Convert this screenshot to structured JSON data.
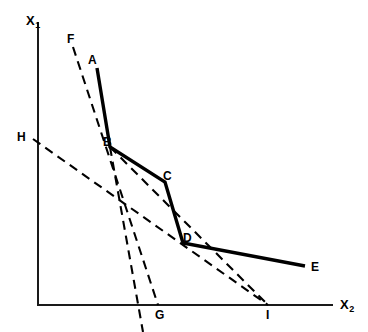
{
  "figure": {
    "type": "line-diagram",
    "background_color": "#ffffff",
    "stroke_color": "#000000",
    "width": 368,
    "height": 332
  },
  "axes": {
    "origin": {
      "x": 38,
      "y": 305
    },
    "y_axis": {
      "label_text": "X",
      "label_sub": "1",
      "label_x": 26,
      "label_y": 14,
      "top_y": 22,
      "bottom_y": 305
    },
    "x_axis": {
      "label_text": "X",
      "label_sub": "2",
      "label_x": 340,
      "label_y": 298,
      "left_x": 38,
      "right_x": 333
    }
  },
  "points": {
    "A": {
      "label": "A",
      "x": 97,
      "y": 68,
      "label_x": 88,
      "label_y": 54
    },
    "B": {
      "label": "B",
      "x": 110,
      "y": 147,
      "label_x": 103,
      "label_y": 136
    },
    "C": {
      "label": "C",
      "x": 165,
      "y": 182,
      "label_x": 163,
      "label_y": 170
    },
    "D": {
      "label": "D",
      "x": 183,
      "y": 243,
      "label_x": 183,
      "label_y": 232
    },
    "E": {
      "label": "E",
      "x": 305,
      "y": 266,
      "label_x": 311,
      "label_y": 261
    },
    "F": {
      "label": "F",
      "x": 73,
      "y": 47,
      "label_x": 67,
      "label_y": 33
    },
    "G": {
      "label": "G",
      "x": 158,
      "y": 305,
      "label_x": 155,
      "label_y": 309
    },
    "H": {
      "label": "H",
      "x": 33,
      "y": 139,
      "label_x": 17,
      "label_y": 131
    },
    "I": {
      "label": "I",
      "x": 268,
      "y": 305,
      "label_x": 266,
      "label_y": 309
    }
  },
  "solid_polyline": {
    "name": "efficient-frontier",
    "vertices": [
      "A",
      "B",
      "C",
      "D",
      "E"
    ],
    "path": "M 97 68 L 110 147 L 165 182 L 183 243 L 305 266"
  },
  "dashed_lines": [
    {
      "name": "iso-line-F-G",
      "from": "F",
      "to": "G",
      "passes_through": "B",
      "path": "M 73 47 L 158 305"
    },
    {
      "name": "iso-line-B-G2",
      "from": "B",
      "to": "bottom",
      "path": "M 110 147 L 143 332"
    },
    {
      "name": "iso-line-B-I",
      "from": "B",
      "to": "I",
      "path": "M 110 147 L 268 305"
    },
    {
      "name": "iso-line-H-I",
      "from": "H",
      "to": "I",
      "passes_through": "D",
      "path": "M 33 139 L 268 305"
    }
  ]
}
